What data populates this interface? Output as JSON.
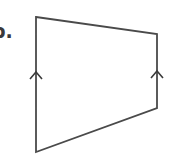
{
  "problem": {
    "label": "b.",
    "shape": "trapezoid",
    "description": "Quadrilateral with one pair of parallel (vertical) sides marked with arrowheads",
    "stroke_color": "#4a4a4a",
    "vertices": {
      "top_left": [
        36,
        17
      ],
      "top_right": [
        157,
        34
      ],
      "bottom_right": [
        157,
        108
      ],
      "bottom_left": [
        36,
        152
      ]
    },
    "parallel_marks": [
      {
        "side": "left",
        "apex": [
          36,
          72
        ]
      },
      {
        "side": "right",
        "apex": [
          157,
          71
        ]
      }
    ]
  }
}
